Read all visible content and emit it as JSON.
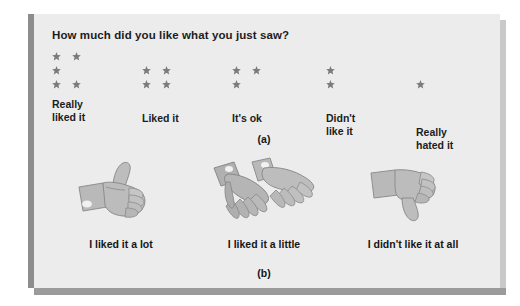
{
  "figure": {
    "panel_a": {
      "caption": "(a)",
      "question": "How much did you like what you just saw?",
      "icon": "star-icon",
      "options": [
        {
          "label": "Really\nliked it",
          "stars": 5,
          "rows": [
            2,
            1,
            2
          ]
        },
        {
          "label": "Liked it",
          "stars": 4,
          "rows": [
            2,
            2
          ]
        },
        {
          "label": "It's ok",
          "stars": 3,
          "rows": [
            2,
            1
          ]
        },
        {
          "label": "Didn't\nlike it",
          "stars": 2,
          "rows": [
            1,
            1
          ]
        },
        {
          "label": "Really\nhated it",
          "stars": 1,
          "rows": [
            1
          ]
        }
      ]
    },
    "panel_b": {
      "caption": "(b)",
      "options": [
        {
          "label": "I liked it a lot",
          "icon": "thumbs-up-icon"
        },
        {
          "label": "I liked it a little",
          "icon": "flat-hands-icon"
        },
        {
          "label": "I didn't like it at all",
          "icon": "thumbs-down-icon"
        }
      ]
    }
  },
  "colors": {
    "card_background": "#ececec",
    "star": "#7b7b7b",
    "text": "#1c1c1c",
    "hand_light": "#c9c9c9",
    "hand_mid": "#a8a8a8",
    "hand_dark": "#8a8a8a"
  }
}
